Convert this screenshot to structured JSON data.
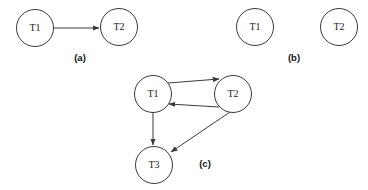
{
  "figure": {
    "canvas": {
      "width": 368,
      "height": 190,
      "background": "#ffffff"
    },
    "style": {
      "node_stroke": "#3a3a3a",
      "node_fill": "#ffffff",
      "edge_stroke": "#3a3a3a",
      "label_color": "#1a1a1a",
      "caption_color": "#121212",
      "node_radius": 18.5
    },
    "panels": [
      {
        "id": "panel-a",
        "caption": "(a)",
        "caption_pos": {
          "x": 80,
          "y": 58
        },
        "nodes": [
          {
            "id": "a-t1",
            "label": "T1",
            "cx": 35,
            "cy": 28,
            "r": 18.5
          },
          {
            "id": "a-t2",
            "label": "T2",
            "cx": 119,
            "cy": 27,
            "r": 18.5
          }
        ],
        "edges": [
          {
            "id": "a-e1",
            "from": "T1",
            "to": "T2",
            "x1": 54,
            "y1": 28,
            "x2": 99,
            "y2": 28,
            "arrow": "end"
          }
        ]
      },
      {
        "id": "panel-b",
        "caption": "(b)",
        "caption_pos": {
          "x": 294,
          "y": 58
        },
        "nodes": [
          {
            "id": "b-t1",
            "label": "T1",
            "cx": 255,
            "cy": 27,
            "r": 18.5
          },
          {
            "id": "b-t2",
            "label": "T2",
            "cx": 339,
            "cy": 27,
            "r": 18.5
          }
        ],
        "edges": []
      },
      {
        "id": "panel-c",
        "caption": "(c)",
        "caption_pos": {
          "x": 205,
          "y": 164
        },
        "nodes": [
          {
            "id": "c-t1",
            "label": "T1",
            "cx": 153,
            "cy": 94,
            "r": 18.5
          },
          {
            "id": "c-t2",
            "label": "T2",
            "cx": 233,
            "cy": 94,
            "r": 18.5
          },
          {
            "id": "c-t3",
            "label": "T3",
            "cx": 154,
            "cy": 165,
            "r": 18.5
          }
        ],
        "edges": [
          {
            "id": "c-e1",
            "from": "T1",
            "to": "T2",
            "x1": 168,
            "y1": 83,
            "x2": 219,
            "y2": 79,
            "arrow": "end"
          },
          {
            "id": "c-e2",
            "from": "T2",
            "to": "T1",
            "x1": 219,
            "y1": 107,
            "x2": 169,
            "y2": 104,
            "arrow": "end"
          },
          {
            "id": "c-e3",
            "from": "T1",
            "to": "T3",
            "x1": 153,
            "y1": 112,
            "x2": 153,
            "y2": 145,
            "arrow": "end"
          },
          {
            "id": "c-e4",
            "from": "T2",
            "to": "T3",
            "x1": 230,
            "y1": 112,
            "x2": 171,
            "y2": 152,
            "arrow": "end"
          }
        ]
      }
    ]
  }
}
